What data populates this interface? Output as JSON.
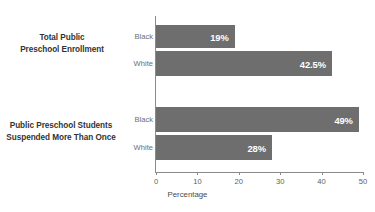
{
  "chart_data": {
    "type": "bar",
    "orientation": "horizontal",
    "title": "",
    "xlabel": "Percentage",
    "ylabel": "",
    "xlim": [
      0,
      50
    ],
    "xticks": [
      0,
      10,
      20,
      30,
      40,
      50
    ],
    "xtick_labels": [
      "0",
      "10",
      "20",
      "30",
      "40",
      "50"
    ],
    "grid": false,
    "legend": "none",
    "bar_color": "#6e6e6e",
    "value_label_color": "#ffffff",
    "groups": [
      {
        "label_lines": [
          "Total Public",
          "Preschool Enrollment"
        ],
        "bars": [
          {
            "series": "Black",
            "value": 19,
            "value_label": "19%"
          },
          {
            "series": "White",
            "value": 42.5,
            "value_label": "42.5%"
          }
        ]
      },
      {
        "label_lines": [
          "Public Preschool Students",
          "Suspended More Than Once"
        ],
        "bars": [
          {
            "series": "Black",
            "value": 49,
            "value_label": "49%"
          },
          {
            "series": "White",
            "value": 28,
            "value_label": "28%"
          }
        ]
      }
    ],
    "categories": [
      "Total Public Preschool Enrollment - Black",
      "Total Public Preschool Enrollment - White",
      "Public Preschool Students Suspended More Than Once - Black",
      "Public Preschool Students Suspended More Than Once - White"
    ],
    "values": [
      19,
      42.5,
      49,
      28
    ]
  }
}
